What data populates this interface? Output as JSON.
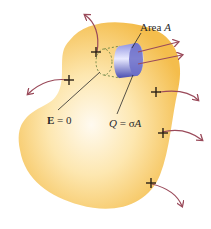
{
  "diagram": {
    "labels": {
      "area": "Area ",
      "area_var": "A",
      "field": "E",
      "field_eq": " = 0",
      "charge_var": "Q",
      "charge_eq": " = σ",
      "charge_var2": "A"
    },
    "colors": {
      "conductor": "#f6c457",
      "conductor_highlight": "#fff6dc",
      "cylinder": "#6c6fc9",
      "arrow": "#9a4a5a",
      "plus": "#2a2016"
    },
    "charges": [
      "+",
      "+",
      "+",
      "+",
      "+"
    ]
  }
}
